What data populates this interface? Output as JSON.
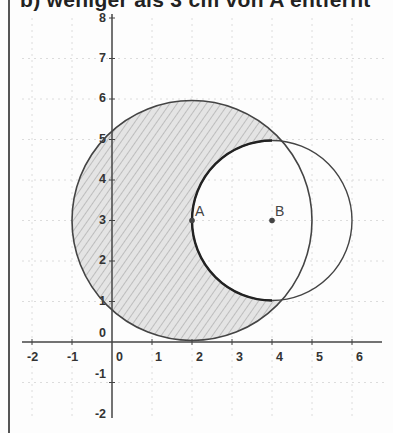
{
  "heading": "b) weniger als 3 cm von A entfernt",
  "diagram": {
    "x_ticks": [
      "-2",
      "-1",
      "0",
      "1",
      "2",
      "3",
      "4",
      "5",
      "6"
    ],
    "y_ticks": [
      "8",
      "7",
      "6",
      "5",
      "4",
      "3",
      "2",
      "1",
      "0",
      "-1",
      "-2"
    ],
    "points": [
      {
        "name": "A",
        "x": 2,
        "y": 3
      },
      {
        "name": "B",
        "x": 4,
        "y": 3
      }
    ],
    "circles": [
      {
        "center": "A",
        "radius": 3,
        "shaded": true
      },
      {
        "center": "B",
        "radius": 2,
        "shaded": false
      }
    ],
    "colors": {
      "stroke": "#444444",
      "shade": "#cfcfcf",
      "grid": "#d8d8d8"
    }
  }
}
